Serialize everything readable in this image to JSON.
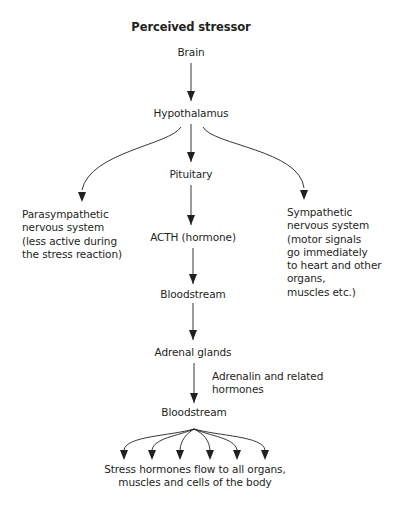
{
  "diagram": {
    "title": "Perceived stressor",
    "nodes": {
      "brain": "Brain",
      "hypothalamus": "Hypothalamus",
      "pituitary": "Pituitary",
      "parasympathetic": [
        "Parasympathetic",
        "nervous system",
        "(less active during",
        "the stress reaction)"
      ],
      "sympathetic": [
        "Sympathetic",
        "nervous system",
        "(motor signals",
        "go immediately",
        "to heart and other",
        "organs,",
        "muscles etc.)"
      ],
      "acth": "ACTH (hormone)",
      "bloodstream1": "Bloodstream",
      "adrenal": "Adrenal glands",
      "adrenalin_label": [
        "Adrenalin and related",
        "hormones"
      ],
      "bloodstream2": "Bloodstream",
      "outcome": [
        "Stress hormones flow to all organs,",
        "muscles and cells of the body"
      ]
    },
    "edges": [
      [
        "Brain",
        "Hypothalamus"
      ],
      [
        "Hypothalamus",
        "Parasympathetic nervous system"
      ],
      [
        "Hypothalamus",
        "Pituitary"
      ],
      [
        "Hypothalamus",
        "Sympathetic nervous system"
      ],
      [
        "Pituitary",
        "ACTH (hormone)"
      ],
      [
        "ACTH (hormone)",
        "Bloodstream"
      ],
      [
        "Bloodstream",
        "Adrenal glands"
      ],
      [
        "Adrenal glands",
        "Bloodstream"
      ],
      [
        "Bloodstream",
        "Stress hormones flow to all organs (x6 arrows)"
      ]
    ]
  }
}
